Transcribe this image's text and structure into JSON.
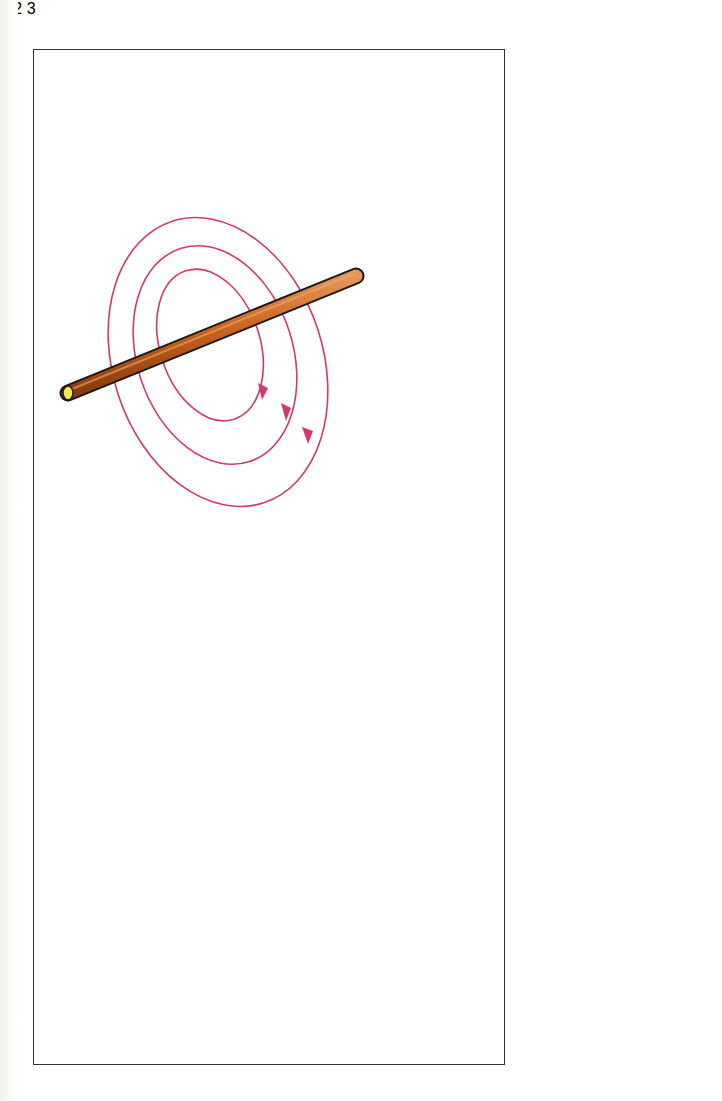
{
  "figures": [
    {
      "id": 1,
      "label": "1",
      "description": "Straight current-carrying copper wire with concentric circular magnetic field lines"
    },
    {
      "id": 2,
      "label": "2",
      "description": "Single wire loop with current in and out; magnetic field lines loop around each side and pass through the loop"
    },
    {
      "id": 3,
      "label": "3",
      "description": "Coil (solenoid) cross-section with four turns; field lines concentrate through the center and return around the outside"
    }
  ],
  "colors": {
    "field_line": "#d63a63",
    "wire_copper": "#c8651e",
    "wire_end": "#f3ea4a",
    "conductor": "#111111",
    "frame": "#333333",
    "background": "#ffffff"
  }
}
